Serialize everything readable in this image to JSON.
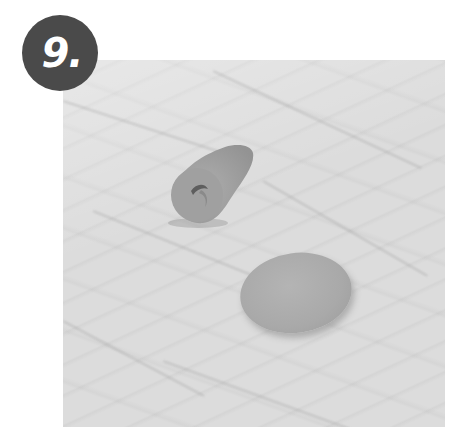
{
  "step_badge": {
    "label": "9.",
    "background_color": "#4a4a4a",
    "text_color": "#ffffff"
  },
  "photo": {
    "description": "Two gray clay pieces on a white marble surface: a rolled cone with an opening, and a flat round disc",
    "background_color": "#dcdcdc",
    "objects": [
      {
        "name": "clay-cone",
        "color": "#a3a3a3"
      },
      {
        "name": "clay-disc",
        "color": "#acacac"
      }
    ]
  }
}
